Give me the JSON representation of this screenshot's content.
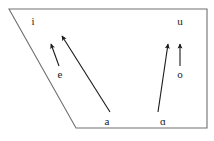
{
  "figure": {
    "type": "vowel-chart",
    "outline_color": "#707070",
    "arrow_color": "#1a1a1a",
    "label_color": "#1a1a1a",
    "background_color": "#ffffff"
  },
  "trapezoid": {
    "points": "9,9 207,9 207,128 76,128",
    "name": "vowel-quadrilateral"
  },
  "labels": [
    {
      "id": "i",
      "text": "i",
      "x": 33,
      "y": 21
    },
    {
      "id": "u",
      "text": "u",
      "x": 180,
      "y": 21
    },
    {
      "id": "e",
      "text": "e",
      "x": 60,
      "y": 74
    },
    {
      "id": "o",
      "text": "o",
      "x": 180,
      "y": 74
    },
    {
      "id": "a",
      "text": "a",
      "x": 107,
      "y": 121
    },
    {
      "id": "script-a",
      "text": "ɑ",
      "x": 163,
      "y": 121
    }
  ],
  "arrows": [
    {
      "id": "e-to-i",
      "from_label": "e",
      "to_label": "i",
      "x1": 59,
      "y1": 66,
      "x2": 51,
      "y2": 44,
      "length": "short"
    },
    {
      "id": "a-to-e",
      "from_label": "a",
      "to_label": "e",
      "x1": 110,
      "y1": 112,
      "x2": 62,
      "y2": 36,
      "length": "long"
    },
    {
      "id": "script-a-to-o",
      "from_label": "ɑ",
      "to_label": "o",
      "x1": 158,
      "y1": 112,
      "x2": 168,
      "y2": 44,
      "length": "long"
    },
    {
      "id": "o-to-u",
      "from_label": "o",
      "to_label": "u",
      "x1": 180,
      "y1": 66,
      "x2": 180,
      "y2": 44,
      "length": "short"
    }
  ]
}
